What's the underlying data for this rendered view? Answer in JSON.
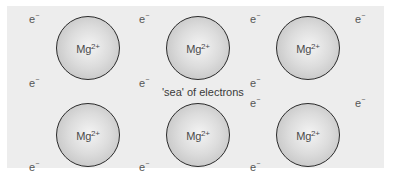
{
  "diagram": {
    "caption": "'sea' of electrons",
    "ions": [
      {
        "symbol": "Mg",
        "charge": "2+",
        "row": 1,
        "col": 1
      },
      {
        "symbol": "Mg",
        "charge": "2+",
        "row": 1,
        "col": 2
      },
      {
        "symbol": "Mg",
        "charge": "2+",
        "row": 1,
        "col": 3
      },
      {
        "symbol": "Mg",
        "charge": "2+",
        "row": 2,
        "col": 1
      },
      {
        "symbol": "Mg",
        "charge": "2+",
        "row": 2,
        "col": 2
      },
      {
        "symbol": "Mg",
        "charge": "2+",
        "row": 2,
        "col": 3
      }
    ],
    "electron": {
      "symbol": "e",
      "charge": "−"
    },
    "electron_count": 12,
    "colors": {
      "panel": "#ededed",
      "ion_edge": "#2a2a2a",
      "text": "#555555"
    }
  }
}
